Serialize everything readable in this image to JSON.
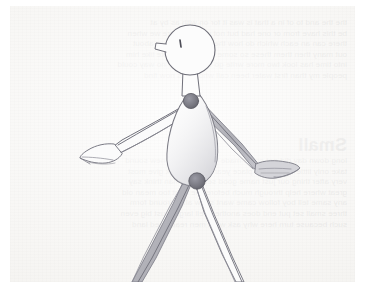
{
  "image": {
    "kind": "pencil-sketch-photo",
    "subject": "articulated stick figure walking",
    "medium": "graphite pencil on paper",
    "paper_color": "#f7f6f4",
    "page_margin_color": "#ffffff",
    "pencil_line_color": "#6f6f77",
    "pencil_shade_color": "#b4b4ba",
    "joint_dot_color": "#767680",
    "alt_text": "A light pencil drawing of a simple articulated figure with a round head, short neck, teardrop torso, two arms ending in mitten-shaped hands, and two legs splayed apart running off the bottom edge of the paper."
  },
  "figure": {
    "parts": [
      {
        "name": "head",
        "label": "Head",
        "shape": "circle"
      },
      {
        "name": "nose",
        "label": "Nose",
        "shape": "small-stub-left"
      },
      {
        "name": "eye",
        "label": "Eye",
        "shape": "dot"
      },
      {
        "name": "neck",
        "label": "Neck",
        "shape": "short-rectangle"
      },
      {
        "name": "torso",
        "label": "Torso",
        "shape": "teardrop-oval"
      },
      {
        "name": "shoulder-joint",
        "label": "Shoulder joint",
        "shape": "filled-circle"
      },
      {
        "name": "hip-joint",
        "label": "Hip joint",
        "shape": "filled-circle"
      },
      {
        "name": "left-arm",
        "label": "Left arm",
        "shape": "tapered-limb"
      },
      {
        "name": "left-hand",
        "label": "Left hand",
        "shape": "mitten"
      },
      {
        "name": "right-arm",
        "label": "Right arm",
        "shape": "tapered-limb"
      },
      {
        "name": "right-hand",
        "label": "Right hand",
        "shape": "mitten"
      },
      {
        "name": "left-leg",
        "label": "Left leg",
        "shape": "tapered-limb"
      },
      {
        "name": "right-leg",
        "label": "Right leg",
        "shape": "tapered-limb"
      }
    ]
  },
  "bleed_through": {
    "note": "faint mirrored printing showing through from the reverse side of the sheet",
    "heading": "Small",
    "blocks": [
      {
        "top": 12,
        "lines": [
          "the the and to of in a that is was it for on with as by at",
          "be this have from or one had but not what all were we when",
          "there can an each which do how their if will up other about",
          "out many then them these so some her would make like him",
          "into time has look two more write go see number no way could",
          "people my than first water been call who oil its now find"
        ]
      },
      {
        "top": 128,
        "heading": "Small",
        "lines": [
          "long down day did get come made may part over new sound",
          "take only little work know place year live me back give most",
          "very after thing our just name good sentence man think say",
          "great where help through much before line right too mean old",
          "any same tell boy follow came want show also around form",
          "three small set put end does another well large must big even",
          "such because turn here why ask went men read need land"
        ]
      }
    ]
  }
}
